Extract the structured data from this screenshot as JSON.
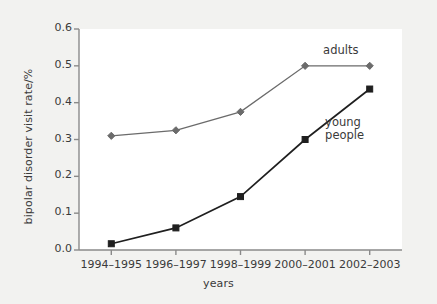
{
  "chart_data": {
    "type": "line",
    "title": "",
    "xlabel": "years",
    "ylabel": "bipolar disorder visit rate/%",
    "categories": [
      "1994–1995",
      "1996–1997",
      "1998–1999",
      "2000–2001",
      "2002–2003"
    ],
    "ylim": [
      0.0,
      0.6
    ],
    "yticks": [
      "0.0",
      "0.1",
      "0.2",
      "0.3",
      "0.4",
      "0.5",
      "0.6"
    ],
    "ytick_values": [
      0.0,
      0.1,
      0.2,
      0.3,
      0.4,
      0.5,
      0.6
    ],
    "grid": false,
    "legend_position": "inline-annotation",
    "series": [
      {
        "name": "adults",
        "values": [
          0.31,
          0.325,
          0.375,
          0.5,
          0.5
        ],
        "marker": "diamond",
        "color": "#6b6b6b",
        "annotation": "adults"
      },
      {
        "name": "young people",
        "values": [
          0.017,
          0.06,
          0.145,
          0.3,
          0.437
        ],
        "marker": "square",
        "color": "#1f1f1f",
        "annotation": "young\npeople"
      }
    ],
    "annotations": [
      {
        "text": "adults",
        "series": "adults"
      },
      {
        "text_line1": "young",
        "text_line2": "people",
        "series": "young people"
      }
    ]
  },
  "figure": {
    "background_color": "#f2f2f0",
    "plot_background_color": "#ffffff",
    "axis_color": "#8a8a8a",
    "text_color": "#3a3a3a"
  }
}
